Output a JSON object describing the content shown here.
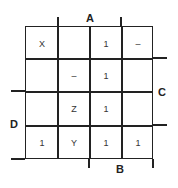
{
  "diagram": {
    "type": "karnaugh-map",
    "labels": {
      "a": "A",
      "b": "B",
      "c": "C",
      "d": "D"
    },
    "cells": [
      [
        "X",
        "",
        "1",
        "–"
      ],
      [
        "",
        "–",
        "1",
        ""
      ],
      [
        "",
        "Z",
        "1",
        ""
      ],
      [
        "1",
        "Y",
        "1",
        "1"
      ]
    ]
  }
}
